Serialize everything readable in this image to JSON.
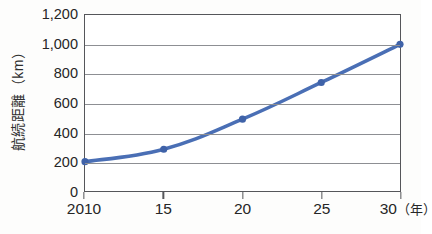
{
  "chart_data": {
    "type": "line",
    "title": "",
    "subtitle": "",
    "xlabel": "",
    "x_unit_label": "（年）",
    "ylabel": "航続距離（km）",
    "categories": [
      "2010",
      "15",
      "20",
      "25",
      "30"
    ],
    "x_values": [
      2010,
      2015,
      2020,
      2025,
      2030
    ],
    "values": [
      200,
      285,
      490,
      740,
      1000
    ],
    "series": [
      {
        "name": "航続距離",
        "values": [
          200,
          285,
          490,
          740,
          1000
        ]
      }
    ],
    "ylim": [
      0,
      1200
    ],
    "y_ticks": [
      0,
      200,
      400,
      600,
      800,
      1000,
      1200
    ],
    "y_tick_labels": [
      "0",
      "200",
      "400",
      "600",
      "800",
      "1,000",
      "1,200"
    ],
    "grid": true,
    "grid_axis": "y",
    "legend": false,
    "legend_position": "none",
    "markers": true,
    "marker_shape": "circle",
    "line_color": "#4a6fb5",
    "marker_color": "#3f62a8",
    "grid_color": "#8d8f93",
    "frame_color": "#55565a",
    "text_color": "#262626",
    "background_color": "#ffffff"
  }
}
